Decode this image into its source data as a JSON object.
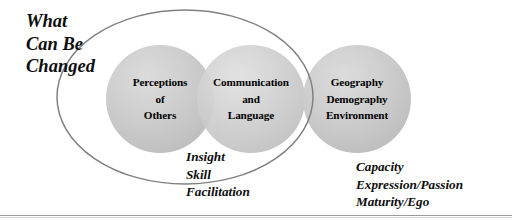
{
  "diagram": {
    "title_lines": [
      "What",
      "Can Be",
      "Changed"
    ],
    "boundary_shape": "ellipse",
    "boundary_color": "#808080",
    "circle_fill": "#c9c9c9",
    "background": "#ffffff",
    "circles": [
      {
        "id": "perceptions-of-others",
        "lines": [
          "Perceptions",
          "of",
          "Others"
        ],
        "inside_boundary": true
      },
      {
        "id": "communication-and-language",
        "lines": [
          "Communication",
          "and",
          "Language"
        ],
        "inside_boundary": true
      },
      {
        "id": "geography-demography-environment",
        "lines": [
          "Geography",
          "Demography",
          "Environment"
        ],
        "inside_boundary": false
      }
    ],
    "captions": [
      {
        "id": "inner-caption",
        "lines": [
          "Insight",
          "Skill",
          "Facilitation"
        ]
      },
      {
        "id": "outer-caption",
        "lines": [
          "Capacity",
          "Expression/Passion",
          "Maturity/Ego"
        ]
      }
    ]
  }
}
